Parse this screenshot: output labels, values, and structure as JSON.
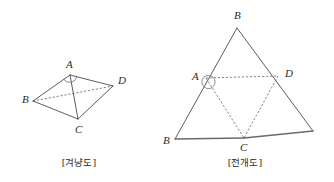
{
  "page": {
    "background_color": "#ffffff",
    "width": 334,
    "height": 182
  },
  "style": {
    "line_color": "#4a4a4a",
    "base_line_color": "#6a6a6a",
    "dashed_line_color": "#656565",
    "text_color": "#2b2b2b"
  },
  "figures": [
    {
      "id": "isometric-view",
      "caption": "[겨냥도]",
      "caption_position": {
        "x": 79,
        "y": 163
      },
      "shape_type": "tetrahedron",
      "vertices": [
        {
          "name": "A",
          "x": 70,
          "y": 75,
          "label": "A",
          "label_x": 66,
          "label_y": 68
        },
        {
          "name": "B",
          "x": 33,
          "y": 101,
          "label": "B",
          "label_x": 22,
          "label_y": 103
        },
        {
          "name": "C",
          "x": 78,
          "y": 119,
          "label": "C",
          "label_x": 75,
          "label_y": 133
        },
        {
          "name": "D",
          "x": 113,
          "y": 86,
          "label": "D",
          "label_x": 118,
          "label_y": 84
        }
      ],
      "edges_solid": [
        {
          "from": "A",
          "to": "B"
        },
        {
          "from": "A",
          "to": "D"
        },
        {
          "from": "A",
          "to": "C"
        },
        {
          "from": "B",
          "to": "C"
        },
        {
          "from": "C",
          "to": "D"
        }
      ],
      "edges_dashed": [
        {
          "from": "B",
          "to": "D"
        }
      ],
      "angle_marks": [
        {
          "at": "A",
          "type": "arc",
          "radius": 6.5
        }
      ]
    },
    {
      "id": "net-view",
      "caption": "[전개도]",
      "caption_position": {
        "x": 245,
        "y": 163
      },
      "shape_type": "triangle-net",
      "vertices": [
        {
          "name": "B_top",
          "x": 237,
          "y": 28,
          "label": "B",
          "label_x": 234,
          "label_y": 19
        },
        {
          "name": "A",
          "x": 206,
          "y": 78,
          "label": "A",
          "label_x": 192,
          "label_y": 79
        },
        {
          "name": "D",
          "x": 278,
          "y": 76,
          "label": "D",
          "label_x": 285,
          "label_y": 76
        },
        {
          "name": "B_left",
          "x": 175,
          "y": 139,
          "label": "B",
          "label_x": 164,
          "label_y": 143
        },
        {
          "name": "C",
          "x": 244,
          "y": 138,
          "label": "C",
          "label_x": 241,
          "label_y": 150
        },
        {
          "name": "B_right",
          "x": 313,
          "y": 131,
          "label": "",
          "label_x": 0,
          "label_y": 0
        }
      ],
      "edges_solid": [
        {
          "from": "B_left",
          "to": "B_top"
        },
        {
          "from": "B_top",
          "to": "B_right"
        }
      ],
      "edges_base": [
        {
          "from": "B_left",
          "to": "C"
        },
        {
          "from": "C",
          "to": "B_right"
        }
      ],
      "edges_dashed": [
        {
          "from": "A",
          "to": "D"
        },
        {
          "from": "A",
          "to": "C"
        },
        {
          "from": "D",
          "to": "C"
        }
      ],
      "angle_marks": [
        {
          "at": "A",
          "type": "circle",
          "radius": 6.5
        }
      ]
    }
  ]
}
